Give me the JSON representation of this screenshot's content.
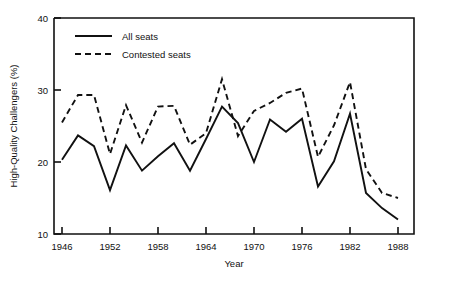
{
  "chart_data": {
    "type": "line",
    "title": "",
    "xlabel": "Year",
    "ylabel": "High-Quality Challengers (%)",
    "xlim": [
      1945,
      1990
    ],
    "ylim": [
      10,
      40
    ],
    "grid": false,
    "legend_position": "top-left",
    "xticks": [
      1946,
      1952,
      1958,
      1964,
      1970,
      1976,
      1982,
      1988
    ],
    "xtick_labels": [
      "1946",
      "1952",
      "1958",
      "1964",
      "1970",
      "1976",
      "1982",
      "1988"
    ],
    "yticks": [
      10,
      20,
      30,
      40
    ],
    "ytick_labels": [
      "10",
      "20",
      "30",
      "40"
    ],
    "x": [
      1946,
      1948,
      1950,
      1952,
      1954,
      1956,
      1958,
      1960,
      1962,
      1964,
      1966,
      1968,
      1970,
      1972,
      1974,
      1976,
      1978,
      1980,
      1982,
      1984,
      1986,
      1988
    ],
    "series": [
      {
        "name": "All seats",
        "style": "solid",
        "values": [
          20.3,
          23.7,
          22.2,
          16.1,
          22.3,
          18.8,
          20.8,
          22.6,
          18.8,
          23.2,
          27.7,
          25.4,
          20.0,
          25.9,
          24.2,
          26.0,
          16.6,
          20.1,
          26.7,
          15.7,
          13.6,
          12.0
        ]
      },
      {
        "name": "Contested seats",
        "style": "dashed",
        "values": [
          25.5,
          29.3,
          29.3,
          21.1,
          27.9,
          22.7,
          27.7,
          27.8,
          22.4,
          24.0,
          31.5,
          23.6,
          27.1,
          28.2,
          29.6,
          30.2,
          20.7,
          25.1,
          31.1,
          19.0,
          15.7,
          15.0
        ]
      }
    ]
  },
  "legend": {
    "items": [
      {
        "label": "All seats",
        "style": "solid"
      },
      {
        "label": "Contested seats",
        "style": "dashed"
      }
    ]
  },
  "colors": {
    "ink": "#111111",
    "background": "#ffffff"
  }
}
